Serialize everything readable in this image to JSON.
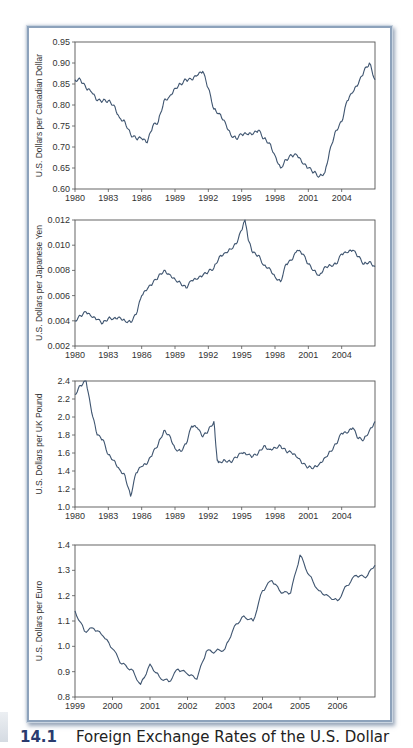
{
  "figure": {
    "caption_number": "14.1",
    "caption_title": "Foreign Exchange Rates of the U.S. Dollar",
    "line_color": "#3f5570",
    "border_color": "#8da2bb"
  },
  "chart_data": [
    {
      "type": "line",
      "title": "",
      "xlabel": "",
      "ylabel": "U.S. Dollars per Canadian Dollar",
      "ylim": [
        0.6,
        0.95
      ],
      "yticks": [
        "0.95",
        "0.90",
        "0.85",
        "0.80",
        "0.75",
        "0.70",
        "0.65",
        "0.60"
      ],
      "xlim": [
        1980,
        2007
      ],
      "xticks": [
        "1980",
        "1983",
        "1986",
        "1989",
        "1992",
        "1995",
        "1998",
        "2001",
        "2004"
      ],
      "x": [
        1980,
        1980.5,
        1981,
        1981.5,
        1982,
        1982.5,
        1983,
        1983.5,
        1984,
        1984.5,
        1985,
        1985.5,
        1986,
        1986.5,
        1987,
        1987.5,
        1988,
        1988.5,
        1989,
        1989.5,
        1990,
        1990.5,
        1991,
        1991.5,
        1992,
        1992.5,
        1993,
        1993.5,
        1994,
        1994.5,
        1995,
        1995.5,
        1996,
        1996.5,
        1997,
        1997.5,
        1998,
        1998.5,
        1999,
        1999.5,
        2000,
        2000.5,
        2001,
        2001.5,
        2002,
        2002.5,
        2003,
        2003.5,
        2004,
        2004.5,
        2005,
        2005.5,
        2006,
        2006.5,
        2007
      ],
      "series": [
        {
          "name": "CAD",
          "values": [
            0.86,
            0.86,
            0.84,
            0.83,
            0.81,
            0.81,
            0.81,
            0.8,
            0.77,
            0.76,
            0.73,
            0.72,
            0.72,
            0.71,
            0.75,
            0.76,
            0.81,
            0.82,
            0.84,
            0.85,
            0.86,
            0.86,
            0.87,
            0.88,
            0.84,
            0.79,
            0.78,
            0.76,
            0.73,
            0.72,
            0.73,
            0.73,
            0.73,
            0.74,
            0.72,
            0.71,
            0.68,
            0.65,
            0.67,
            0.68,
            0.68,
            0.66,
            0.65,
            0.64,
            0.63,
            0.64,
            0.7,
            0.74,
            0.76,
            0.81,
            0.83,
            0.85,
            0.88,
            0.9,
            0.86
          ]
        }
      ]
    },
    {
      "type": "line",
      "title": "",
      "xlabel": "",
      "ylabel": "U.S. Dollars per Japanese Yen",
      "ylim": [
        0.002,
        0.012
      ],
      "yticks": [
        "0.012",
        "0.010",
        "0.008",
        "0.006",
        "0.004",
        "0.002"
      ],
      "xlim": [
        1980,
        2007
      ],
      "xticks": [
        "1980",
        "1983",
        "1986",
        "1989",
        "1992",
        "1995",
        "1998",
        "2001",
        "2004"
      ],
      "x": [
        1980,
        1980.5,
        1981,
        1981.5,
        1982,
        1982.5,
        1983,
        1983.5,
        1984,
        1984.5,
        1985,
        1985.5,
        1986,
        1986.5,
        1987,
        1987.5,
        1988,
        1988.5,
        1989,
        1989.5,
        1990,
        1990.5,
        1991,
        1991.5,
        1992,
        1992.5,
        1993,
        1993.5,
        1994,
        1994.5,
        1995,
        1995.3,
        1995.6,
        1996,
        1996.5,
        1997,
        1997.5,
        1998,
        1998.5,
        1999,
        1999.5,
        2000,
        2000.5,
        2001,
        2001.5,
        2002,
        2002.5,
        2003,
        2003.5,
        2004,
        2004.5,
        2005,
        2005.5,
        2006,
        2006.5,
        2007
      ],
      "series": [
        {
          "name": "JPY",
          "values": [
            0.004,
            0.0044,
            0.0047,
            0.0043,
            0.0041,
            0.0038,
            0.0042,
            0.0042,
            0.0043,
            0.004,
            0.0039,
            0.0045,
            0.006,
            0.0065,
            0.007,
            0.0075,
            0.008,
            0.0077,
            0.0073,
            0.007,
            0.0066,
            0.0072,
            0.0073,
            0.0076,
            0.0079,
            0.0082,
            0.0091,
            0.0094,
            0.0097,
            0.0101,
            0.0112,
            0.012,
            0.0104,
            0.0094,
            0.0092,
            0.0084,
            0.0082,
            0.0075,
            0.0071,
            0.0085,
            0.0088,
            0.0096,
            0.0093,
            0.0085,
            0.008,
            0.0076,
            0.0083,
            0.0084,
            0.0085,
            0.0093,
            0.0094,
            0.0096,
            0.0091,
            0.0085,
            0.0087,
            0.0083
          ]
        }
      ]
    },
    {
      "type": "line",
      "title": "",
      "xlabel": "",
      "ylabel": "U.S. Dollars per UK Pound",
      "ylim": [
        1.0,
        2.4
      ],
      "yticks": [
        "2.4",
        "2.2",
        "2.0",
        "1.8",
        "1.6",
        "1.4",
        "1.2",
        "1.0"
      ],
      "xlim": [
        1980,
        2007
      ],
      "xticks": [
        "1980",
        "1983",
        "1986",
        "1989",
        "1992",
        "1995",
        "1998",
        "2001",
        "2004"
      ],
      "x": [
        1980,
        1980.5,
        1981,
        1981.5,
        1982,
        1982.5,
        1983,
        1983.5,
        1984,
        1984.5,
        1985,
        1985.5,
        1986,
        1986.5,
        1987,
        1987.5,
        1988,
        1988.5,
        1989,
        1989.5,
        1990,
        1990.5,
        1991,
        1991.5,
        1992,
        1992.5,
        1992.8,
        1993,
        1993.5,
        1994,
        1994.5,
        1995,
        1995.5,
        1996,
        1996.5,
        1997,
        1997.5,
        1998,
        1998.5,
        1999,
        1999.5,
        2000,
        2000.5,
        2001,
        2001.5,
        2002,
        2002.5,
        2003,
        2003.5,
        2004,
        2004.5,
        2005,
        2005.5,
        2006,
        2006.5,
        2007
      ],
      "series": [
        {
          "name": "GBP",
          "values": [
            2.25,
            2.35,
            2.4,
            2.05,
            1.8,
            1.75,
            1.58,
            1.52,
            1.42,
            1.35,
            1.12,
            1.38,
            1.45,
            1.48,
            1.6,
            1.7,
            1.85,
            1.8,
            1.65,
            1.62,
            1.7,
            1.9,
            1.88,
            1.78,
            1.85,
            1.95,
            1.52,
            1.5,
            1.52,
            1.5,
            1.55,
            1.6,
            1.58,
            1.56,
            1.6,
            1.68,
            1.64,
            1.66,
            1.68,
            1.62,
            1.6,
            1.55,
            1.48,
            1.44,
            1.44,
            1.48,
            1.55,
            1.62,
            1.7,
            1.82,
            1.82,
            1.88,
            1.76,
            1.75,
            1.85,
            1.95
          ]
        }
      ]
    },
    {
      "type": "line",
      "title": "",
      "xlabel": "",
      "ylabel": "U.S. Dollars per Euro",
      "ylim": [
        0.8,
        1.4
      ],
      "yticks": [
        "1.4",
        "1.3",
        "1.2",
        "1.1",
        "1.0",
        "0.9",
        "0.8"
      ],
      "xlim": [
        1999,
        2007
      ],
      "xticks": [
        "1999",
        "2000",
        "2001",
        "2002",
        "2003",
        "2004",
        "2005",
        "2006"
      ],
      "x": [
        1999,
        1999.25,
        1999.5,
        1999.75,
        2000,
        2000.25,
        2000.5,
        2000.75,
        2001,
        2001.25,
        2001.5,
        2001.75,
        2002,
        2002.25,
        2002.5,
        2002.75,
        2003,
        2003.25,
        2003.5,
        2003.75,
        2004,
        2004.25,
        2004.5,
        2004.75,
        2005,
        2005.25,
        2005.5,
        2005.75,
        2006,
        2006.25,
        2006.5,
        2006.75,
        2007
      ],
      "series": [
        {
          "name": "EUR",
          "values": [
            1.14,
            1.06,
            1.07,
            1.04,
            0.99,
            0.93,
            0.91,
            0.85,
            0.93,
            0.88,
            0.86,
            0.91,
            0.89,
            0.87,
            0.98,
            0.98,
            0.99,
            1.08,
            1.12,
            1.1,
            1.22,
            1.26,
            1.21,
            1.21,
            1.36,
            1.28,
            1.22,
            1.2,
            1.18,
            1.24,
            1.28,
            1.27,
            1.32
          ]
        }
      ]
    }
  ]
}
